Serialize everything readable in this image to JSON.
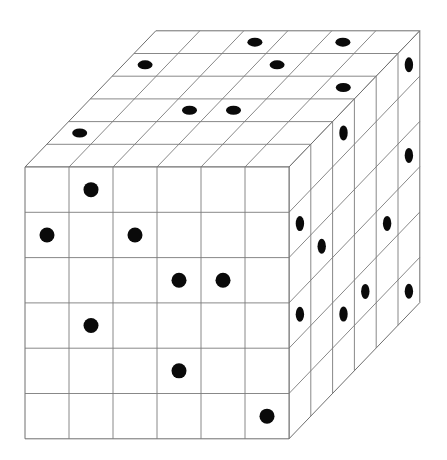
{
  "diagram": {
    "type": "isometric-cube-with-dots",
    "grid_size": 6,
    "colors": {
      "background": "#ffffff",
      "line": "#7a7a7a",
      "dot": "#0a0a0a"
    },
    "geometry": {
      "front_top_left": [
        25,
        167
      ],
      "cell_width": 44,
      "cell_height": 45.3,
      "depth_dx": 21.8,
      "depth_dy": -22.7
    },
    "faces": {
      "front": {
        "label": "front face",
        "dots": [
          {
            "col": 1,
            "row": 0
          },
          {
            "col": 0,
            "row": 1
          },
          {
            "col": 2,
            "row": 1
          },
          {
            "col": 3,
            "row": 2
          },
          {
            "col": 4,
            "row": 2
          },
          {
            "col": 1,
            "row": 3
          },
          {
            "col": 3,
            "row": 4
          },
          {
            "col": 5,
            "row": 5
          }
        ]
      },
      "top": {
        "label": "top face",
        "note": "depth 0 = front edge, depth 5 = back edge",
        "dots": [
          {
            "col": 2,
            "depth": 5
          },
          {
            "col": 4,
            "depth": 5
          },
          {
            "col": 0,
            "depth": 4
          },
          {
            "col": 3,
            "depth": 4
          },
          {
            "col": 5,
            "depth": 3
          },
          {
            "col": 2,
            "depth": 2
          },
          {
            "col": 3,
            "depth": 2
          },
          {
            "col": 0,
            "depth": 1
          }
        ]
      },
      "right": {
        "label": "right face",
        "note": "depth 0 = front edge, depth 5 = back edge; row 0 = top",
        "dots": [
          {
            "depth": 5,
            "row": 0
          },
          {
            "depth": 2,
            "row": 0
          },
          {
            "depth": 5,
            "row": 2
          },
          {
            "depth": 0,
            "row": 1
          },
          {
            "depth": 1,
            "row": 2
          },
          {
            "depth": 4,
            "row": 3
          },
          {
            "depth": 0,
            "row": 3
          },
          {
            "depth": 2,
            "row": 4
          },
          {
            "depth": 3,
            "row": 4
          },
          {
            "depth": 5,
            "row": 5
          }
        ]
      }
    },
    "dot_counts": {
      "front": 8,
      "top": 8,
      "right": 10
    }
  }
}
